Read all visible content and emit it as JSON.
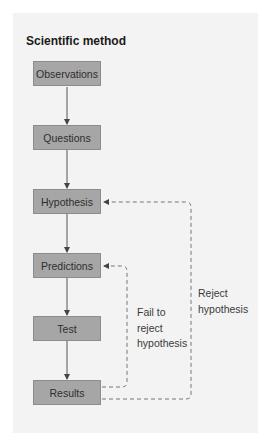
{
  "diagram": {
    "title": "Scientific method",
    "colors": {
      "panel_background": "#f3f3f3",
      "node_fill": "#a6a6a6",
      "node_border": "#8c8c8c",
      "arrow": "#444444",
      "text": "#2e2e2e"
    },
    "nodes": [
      {
        "id": "observations",
        "label": "Observations"
      },
      {
        "id": "questions",
        "label": "Questions"
      },
      {
        "id": "hypothesis",
        "label": "Hypothesis"
      },
      {
        "id": "predictions",
        "label": "Predictions"
      },
      {
        "id": "test",
        "label": "Test"
      },
      {
        "id": "results",
        "label": "Results"
      }
    ],
    "edges": [
      {
        "from": "observations",
        "to": "questions",
        "style": "solid"
      },
      {
        "from": "questions",
        "to": "hypothesis",
        "style": "solid"
      },
      {
        "from": "hypothesis",
        "to": "predictions",
        "style": "solid"
      },
      {
        "from": "predictions",
        "to": "test",
        "style": "solid"
      },
      {
        "from": "test",
        "to": "results",
        "style": "solid"
      },
      {
        "from": "results",
        "to": "predictions",
        "style": "dashed",
        "label": "Fail to reject hypothesis"
      },
      {
        "from": "results",
        "to": "hypothesis",
        "style": "dashed",
        "label": "Reject hypothesis"
      }
    ],
    "loop_labels": {
      "fail_to_reject": [
        "Fail to",
        "reject",
        "hypothesis"
      ],
      "reject": [
        "Reject",
        "hypothesis"
      ]
    }
  }
}
